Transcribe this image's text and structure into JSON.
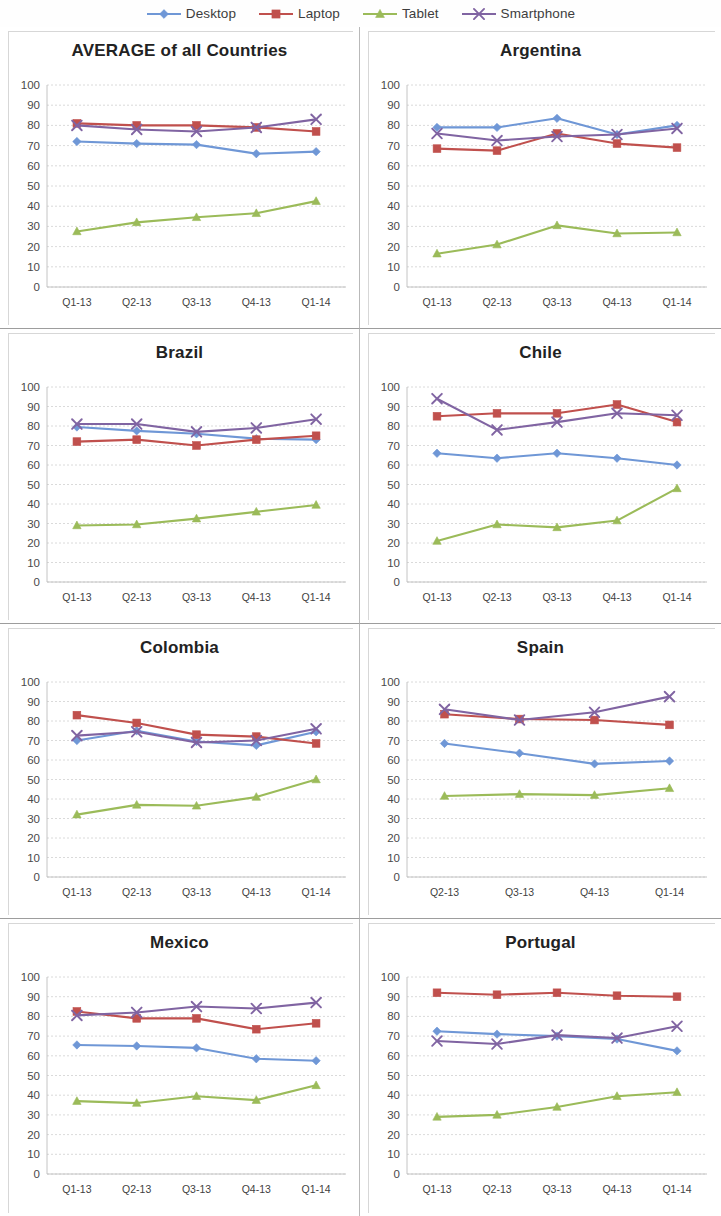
{
  "legend": {
    "items": [
      {
        "label": "Desktop",
        "color": "#6f97d6",
        "marker": "diamond",
        "icon": "series-marker-diamond"
      },
      {
        "label": "Laptop",
        "color": "#c0504d",
        "marker": "square",
        "icon": "series-marker-square"
      },
      {
        "label": "Tablet",
        "color": "#9bbb59",
        "marker": "triangle",
        "icon": "series-marker-triangle"
      },
      {
        "label": "Smartphone",
        "color": "#8064a2",
        "marker": "cross",
        "icon": "series-marker-cross"
      }
    ]
  },
  "axis": {
    "y_ticks": [
      "100",
      "90",
      "80",
      "70",
      "60",
      "50",
      "40",
      "30",
      "20",
      "10",
      "0"
    ],
    "y_min": 0,
    "y_max": 100,
    "y_step": 10
  },
  "chart_data": [
    {
      "type": "line",
      "title": "AVERAGE of all Countries",
      "categories": [
        "Q1-13",
        "Q2-13",
        "Q3-13",
        "Q4-13",
        "Q1-14"
      ],
      "xlabel": "",
      "ylabel": "",
      "ylim": [
        0,
        100
      ],
      "grid": true,
      "legend_position": "top",
      "series": [
        {
          "name": "Desktop",
          "values": [
            72,
            71,
            70.5,
            66,
            67
          ]
        },
        {
          "name": "Laptop",
          "values": [
            81,
            80,
            80,
            79,
            77
          ]
        },
        {
          "name": "Tablet",
          "values": [
            27.5,
            32,
            34.5,
            36.5,
            42.5
          ]
        },
        {
          "name": "Smartphone",
          "values": [
            80,
            78,
            77,
            79,
            83
          ]
        }
      ]
    },
    {
      "type": "line",
      "title": "Argentina",
      "categories": [
        "Q1-13",
        "Q2-13",
        "Q3-13",
        "Q4-13",
        "Q1-14"
      ],
      "xlabel": "",
      "ylabel": "",
      "ylim": [
        0,
        100
      ],
      "grid": true,
      "legend_position": "top",
      "series": [
        {
          "name": "Desktop",
          "values": [
            79,
            79,
            83.5,
            75.5,
            80
          ]
        },
        {
          "name": "Laptop",
          "values": [
            68.5,
            67.5,
            76,
            71,
            69
          ]
        },
        {
          "name": "Tablet",
          "values": [
            16.5,
            21,
            30.5,
            26.5,
            27
          ]
        },
        {
          "name": "Smartphone",
          "values": [
            76,
            72.5,
            74.5,
            75.5,
            78.5
          ]
        }
      ]
    },
    {
      "type": "line",
      "title": "Brazil",
      "categories": [
        "Q1-13",
        "Q2-13",
        "Q3-13",
        "Q4-13",
        "Q1-14"
      ],
      "xlabel": "",
      "ylabel": "",
      "ylim": [
        0,
        100
      ],
      "grid": true,
      "legend_position": "top",
      "series": [
        {
          "name": "Desktop",
          "values": [
            79.5,
            77.5,
            76,
            73.5,
            73
          ]
        },
        {
          "name": "Laptop",
          "values": [
            72,
            73,
            70,
            73,
            75
          ]
        },
        {
          "name": "Tablet",
          "values": [
            29,
            29.5,
            32.5,
            36,
            39.5
          ]
        },
        {
          "name": "Smartphone",
          "values": [
            81,
            81,
            77,
            79,
            83.5
          ]
        }
      ]
    },
    {
      "type": "line",
      "title": "Chile",
      "categories": [
        "Q1-13",
        "Q2-13",
        "Q3-13",
        "Q4-13",
        "Q1-14"
      ],
      "xlabel": "",
      "ylabel": "",
      "ylim": [
        0,
        100
      ],
      "grid": true,
      "legend_position": "top",
      "series": [
        {
          "name": "Desktop",
          "values": [
            66,
            63.5,
            66,
            63.5,
            60
          ]
        },
        {
          "name": "Laptop",
          "values": [
            85,
            86.5,
            86.5,
            91,
            82
          ]
        },
        {
          "name": "Tablet",
          "values": [
            21,
            29.5,
            28,
            31.5,
            48
          ]
        },
        {
          "name": "Smartphone",
          "values": [
            94,
            78,
            82,
            86.5,
            85.5
          ]
        }
      ]
    },
    {
      "type": "line",
      "title": "Colombia",
      "categories": [
        "Q1-13",
        "Q2-13",
        "Q3-13",
        "Q4-13",
        "Q1-14"
      ],
      "xlabel": "",
      "ylabel": "",
      "ylim": [
        0,
        100
      ],
      "grid": true,
      "legend_position": "top",
      "series": [
        {
          "name": "Desktop",
          "values": [
            70,
            75,
            69.5,
            67.5,
            74.5
          ]
        },
        {
          "name": "Laptop",
          "values": [
            83,
            79,
            73,
            72,
            68.5
          ]
        },
        {
          "name": "Tablet",
          "values": [
            32,
            37,
            36.5,
            41,
            50
          ]
        },
        {
          "name": "Smartphone",
          "values": [
            72.5,
            74.5,
            69,
            70,
            76
          ]
        }
      ]
    },
    {
      "type": "line",
      "title": "Spain",
      "categories": [
        "Q2-13",
        "Q3-13",
        "Q4-13",
        "Q1-14"
      ],
      "xlabel": "",
      "ylabel": "",
      "ylim": [
        0,
        100
      ],
      "grid": true,
      "legend_position": "top",
      "series": [
        {
          "name": "Desktop",
          "values": [
            68.5,
            63.5,
            58,
            59.5
          ]
        },
        {
          "name": "Laptop",
          "values": [
            83.5,
            81,
            80.5,
            78
          ]
        },
        {
          "name": "Tablet",
          "values": [
            41.5,
            42.5,
            42,
            45.5
          ]
        },
        {
          "name": "Smartphone",
          "values": [
            86,
            80.5,
            84.5,
            92.5
          ]
        }
      ]
    },
    {
      "type": "line",
      "title": "Mexico",
      "categories": [
        "Q1-13",
        "Q2-13",
        "Q3-13",
        "Q4-13",
        "Q1-14"
      ],
      "xlabel": "",
      "ylabel": "",
      "ylim": [
        0,
        100
      ],
      "grid": true,
      "legend_position": "top",
      "series": [
        {
          "name": "Desktop",
          "values": [
            65.5,
            65,
            64,
            58.5,
            57.5
          ]
        },
        {
          "name": "Laptop",
          "values": [
            82.5,
            79,
            79,
            73.5,
            76.5
          ]
        },
        {
          "name": "Tablet",
          "values": [
            37,
            36,
            39.5,
            37.5,
            45
          ]
        },
        {
          "name": "Smartphone",
          "values": [
            80.5,
            82,
            85,
            84,
            87
          ]
        }
      ]
    },
    {
      "type": "line",
      "title": "Portugal",
      "categories": [
        "Q1-13",
        "Q2-13",
        "Q3-13",
        "Q4-13",
        "Q1-14"
      ],
      "xlabel": "",
      "ylabel": "",
      "ylim": [
        0,
        100
      ],
      "grid": true,
      "legend_position": "top",
      "series": [
        {
          "name": "Desktop",
          "values": [
            72.5,
            71,
            70,
            68.5,
            62.5
          ]
        },
        {
          "name": "Laptop",
          "values": [
            92,
            91,
            92,
            90.5,
            90
          ]
        },
        {
          "name": "Tablet",
          "values": [
            29,
            30,
            34,
            39.5,
            41.5
          ]
        },
        {
          "name": "Smartphone",
          "values": [
            67.5,
            66,
            70.5,
            69,
            75
          ]
        }
      ]
    }
  ]
}
